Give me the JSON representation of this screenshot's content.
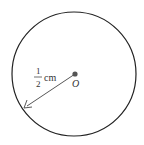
{
  "diagram": {
    "type": "circle-radius",
    "center_label": "O",
    "radius_numerator": "1",
    "radius_denominator": "2",
    "radius_unit": "cm",
    "colors": {
      "circle": "#222222",
      "center_dot": "#555555",
      "arrow": "#444444",
      "text": "#333333"
    }
  }
}
